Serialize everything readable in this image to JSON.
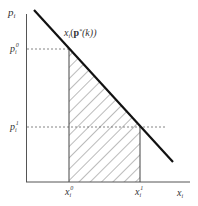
{
  "diagram": {
    "type": "economics-demand-curve",
    "axes": {
      "y_label": "p",
      "y_label_sub": "i",
      "x_label": "x",
      "x_label_sub": "i"
    },
    "curve_label": {
      "prefix": "x",
      "sub": "i",
      "open": "(",
      "bold": "p",
      "sup": "*",
      "rest": "(k))"
    },
    "y_ticks": [
      {
        "base": "p",
        "sub": "i",
        "sup": "0"
      },
      {
        "base": "p",
        "sub": "i",
        "sup": "1"
      }
    ],
    "x_ticks": [
      {
        "base": "x",
        "sub": "i",
        "sup": "0"
      },
      {
        "base": "x",
        "sub": "i",
        "sup": "1"
      }
    ],
    "shaded_region": "hatched area between x_i^0 and x_i^1 under demand curve",
    "colors": {
      "line": "#111111",
      "axis": "#555555",
      "dashed": "#666666",
      "hatch": "#555555"
    }
  }
}
